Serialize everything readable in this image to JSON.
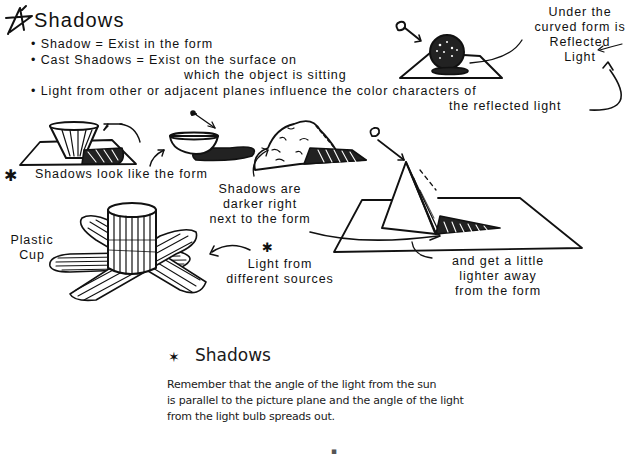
{
  "top_section": {
    "title": "Shadows",
    "title_icon": "star-icon",
    "bullets": [
      "Shadow = Exist in the form",
      "Cast Shadows = Exist on the surface on",
      "which the object is sitting",
      "Light from other or adjacent planes influence the color characters of",
      "the reflected light"
    ],
    "reflected_light_note": [
      "Under the",
      "curved form is",
      "Reflected",
      "Light"
    ]
  },
  "middle_section": {
    "shadows_look_like_form": "Shadows look like the form",
    "plastic_cup_label": [
      "Plastic",
      "Cup"
    ],
    "darker_note": [
      "Shadows are",
      "darker right",
      "next to the form"
    ],
    "light_sources_note": [
      "Light from",
      "different sources"
    ],
    "lighter_note": [
      "and get a little",
      "lighter away",
      "from the form"
    ]
  },
  "bottom_section": {
    "title": "Shadows",
    "title_icon": "star-icon",
    "body_lines": [
      "Remember that the angle of the light from the sun",
      "is parallel to the picture plane and the angle of the light",
      "from the light bulb spreads out."
    ],
    "page_marker": "▪"
  },
  "colors": {
    "ink": "#111111",
    "paper": "#ffffff",
    "print_text": "#1a1a1a"
  }
}
